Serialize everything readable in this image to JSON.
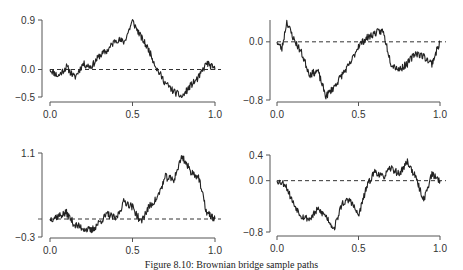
{
  "caption": "Figure 8.10: Brownian bridge sample paths",
  "chart_data": [
    {
      "type": "line",
      "title": "",
      "xlabel": "",
      "ylabel": "",
      "xlim": [
        0,
        1
      ],
      "ylim": [
        -0.5,
        0.9
      ],
      "xticks": [
        "0.0",
        "0.5",
        "1.0"
      ],
      "yticks": [
        {
          "v": 0.9,
          "label": "0.9"
        },
        {
          "v": 0.0,
          "label": "0.0"
        },
        {
          "v": -0.5,
          "label": "-0.5"
        }
      ],
      "reference_line": 0.0,
      "x": [
        0,
        0.05,
        0.1,
        0.15,
        0.2,
        0.25,
        0.3,
        0.35,
        0.4,
        0.45,
        0.5,
        0.55,
        0.6,
        0.65,
        0.7,
        0.75,
        0.8,
        0.85,
        0.9,
        0.95,
        1.0
      ],
      "values": [
        0,
        -0.12,
        0.05,
        -0.15,
        0.1,
        0.05,
        0.25,
        0.35,
        0.55,
        0.5,
        0.88,
        0.6,
        0.35,
        0.0,
        -0.25,
        -0.4,
        -0.5,
        -0.3,
        -0.15,
        0.12,
        0.0
      ],
      "seed": 11
    },
    {
      "type": "line",
      "title": "",
      "xlabel": "",
      "ylabel": "",
      "xlim": [
        0,
        1
      ],
      "ylim": [
        -0.8,
        0.3
      ],
      "xticks": [
        "0.0",
        "0.5",
        "1.0"
      ],
      "yticks": [
        {
          "v": 0.0,
          "label": "0.0"
        },
        {
          "v": -0.8,
          "label": "-0.8"
        }
      ],
      "reference_line": 0.0,
      "x": [
        0,
        0.03,
        0.06,
        0.1,
        0.15,
        0.2,
        0.25,
        0.3,
        0.35,
        0.4,
        0.45,
        0.5,
        0.55,
        0.6,
        0.65,
        0.7,
        0.75,
        0.8,
        0.85,
        0.9,
        0.95,
        1.0
      ],
      "values": [
        0,
        -0.1,
        0.28,
        0.05,
        -0.15,
        -0.45,
        -0.4,
        -0.75,
        -0.62,
        -0.45,
        -0.3,
        -0.05,
        0.05,
        0.12,
        0.15,
        -0.3,
        -0.38,
        -0.3,
        -0.15,
        -0.2,
        -0.3,
        0.0
      ],
      "seed": 23
    },
    {
      "type": "line",
      "title": "",
      "xlabel": "",
      "ylabel": "",
      "xlim": [
        0,
        1
      ],
      "ylim": [
        -0.3,
        1.1
      ],
      "xticks": [
        "0.0",
        "0.5",
        "1.0"
      ],
      "yticks": [
        {
          "v": 1.1,
          "label": "1.1"
        },
        {
          "v": 0.0,
          "label": ""
        },
        {
          "v": -0.3,
          "label": "-0.3"
        }
      ],
      "reference_line": 0.0,
      "x": [
        0,
        0.05,
        0.1,
        0.15,
        0.2,
        0.25,
        0.3,
        0.35,
        0.4,
        0.45,
        0.5,
        0.55,
        0.6,
        0.65,
        0.7,
        0.75,
        0.8,
        0.85,
        0.9,
        0.95,
        1.0
      ],
      "values": [
        0,
        0.05,
        0.1,
        -0.1,
        -0.15,
        -0.2,
        -0.05,
        0.08,
        0.0,
        0.3,
        0.2,
        -0.05,
        0.2,
        0.35,
        0.7,
        0.65,
        1.05,
        0.8,
        0.7,
        0.1,
        0.0
      ],
      "seed": 37
    },
    {
      "type": "line",
      "title": "",
      "xlabel": "",
      "ylabel": "",
      "xlim": [
        0,
        1
      ],
      "ylim": [
        -0.8,
        0.4
      ],
      "xticks": [
        "0.0",
        "0.5",
        "1.0"
      ],
      "yticks": [
        {
          "v": 0.4,
          "label": "0.4"
        },
        {
          "v": 0.0,
          "label": "0.0"
        },
        {
          "v": -0.8,
          "label": "-0.8"
        }
      ],
      "reference_line": 0.0,
      "x": [
        0,
        0.05,
        0.1,
        0.15,
        0.2,
        0.25,
        0.3,
        0.35,
        0.4,
        0.45,
        0.5,
        0.55,
        0.6,
        0.65,
        0.7,
        0.75,
        0.8,
        0.85,
        0.9,
        0.95,
        1.0
      ],
      "values": [
        0,
        -0.05,
        -0.35,
        -0.55,
        -0.6,
        -0.45,
        -0.55,
        -0.75,
        -0.35,
        -0.3,
        -0.55,
        -0.1,
        0.15,
        0.05,
        0.2,
        0.1,
        0.3,
        0.05,
        -0.3,
        0.1,
        0.0
      ],
      "seed": 53
    }
  ]
}
